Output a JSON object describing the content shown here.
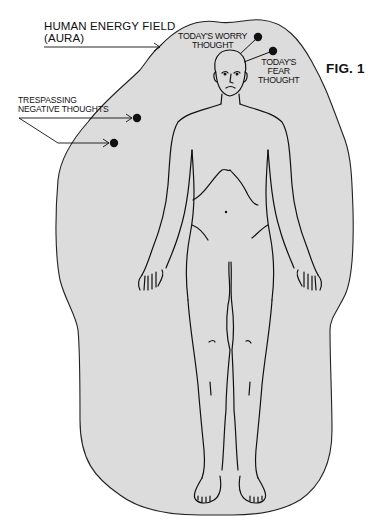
{
  "figure": {
    "id_label": "FIG. 1",
    "background_color": "#ffffff",
    "aura_fill": "#dcdcdc",
    "line_color": "#111111"
  },
  "labels": {
    "aura": {
      "line1": "HUMAN ENERGY FIELD",
      "line2": "(AURA)"
    },
    "trespassing": {
      "line1": "TRESPASSING",
      "line2": "NEGATIVE THOUGHTS"
    },
    "worry": {
      "line1": "TODAY'S WORRY",
      "line2": "THOUGHT"
    },
    "fear": {
      "line1": "TODAY'S",
      "line2": "FEAR",
      "line3": "THOUGHT"
    }
  },
  "thought_dots": [
    {
      "name": "worry-thought-dot",
      "x": 258,
      "y": 37
    },
    {
      "name": "fear-thought-dot",
      "x": 273,
      "y": 51
    },
    {
      "name": "negative-thought-dot-1",
      "x": 137,
      "y": 118
    },
    {
      "name": "negative-thought-dot-2",
      "x": 114,
      "y": 143
    }
  ]
}
